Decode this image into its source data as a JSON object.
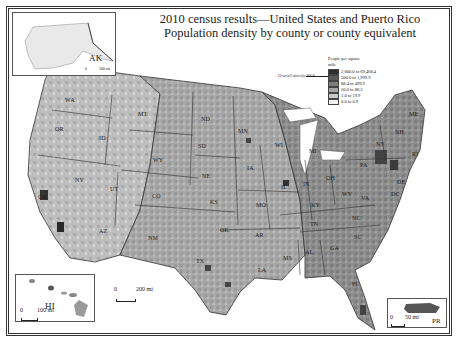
{
  "title": {
    "line1": "2010 census results—United States and Puerto Rico",
    "line2": "Population density by county or county equivalent"
  },
  "legend": {
    "header": "People per square mile",
    "items": [
      {
        "label": "2,000.0 to 69,468.4",
        "color": "#2e2e2e"
      },
      {
        "label": "500.0 to 1,999.9",
        "color": "#595959"
      },
      {
        "label": "88.4 to 499.9",
        "color": "#7e7e7e"
      },
      {
        "label": "20.0 to 88.3",
        "color": "#a4a4a4"
      },
      {
        "label": "1.0 to 19.9",
        "color": "#c8c8c8"
      },
      {
        "label": "0.0 to 0.9",
        "color": "#f2f2f2"
      }
    ],
    "overall_density": "Overall density 88.4"
  },
  "insets": {
    "alaska": {
      "label": "AK",
      "scale": "500 mi",
      "scale_zero": "0"
    },
    "hawaii": {
      "label": "HI",
      "scale": "100 mi",
      "scale_zero": "0"
    },
    "puerto_rico": {
      "label": "PR",
      "scale": "50 mi",
      "scale_zero": "0"
    }
  },
  "main_scale": {
    "zero": "0",
    "label": "200 mi"
  },
  "states": [
    {
      "abbr": "WA",
      "x": 70,
      "y": 101
    },
    {
      "abbr": "OR",
      "x": 60,
      "y": 130
    },
    {
      "abbr": "ID",
      "x": 104,
      "y": 139
    },
    {
      "abbr": "MT",
      "x": 143,
      "y": 115
    },
    {
      "abbr": "WY",
      "x": 158,
      "y": 161
    },
    {
      "abbr": "ND",
      "x": 206,
      "y": 120
    },
    {
      "abbr": "SD",
      "x": 203,
      "y": 147
    },
    {
      "abbr": "NE",
      "x": 207,
      "y": 177
    },
    {
      "abbr": "MN",
      "x": 243,
      "y": 132
    },
    {
      "abbr": "IA",
      "x": 252,
      "y": 169
    },
    {
      "abbr": "WI",
      "x": 280,
      "y": 146
    },
    {
      "abbr": "MI",
      "x": 314,
      "y": 152
    },
    {
      "abbr": "IL",
      "x": 286,
      "y": 188
    },
    {
      "abbr": "IN",
      "x": 308,
      "y": 185
    },
    {
      "abbr": "OH",
      "x": 331,
      "y": 179
    },
    {
      "abbr": "PA",
      "x": 365,
      "y": 166
    },
    {
      "abbr": "NY",
      "x": 381,
      "y": 145
    },
    {
      "abbr": "ME",
      "x": 414,
      "y": 115
    },
    {
      "abbr": "NH",
      "x": 400,
      "y": 133
    },
    {
      "abbr": "RI",
      "x": 417,
      "y": 155
    },
    {
      "abbr": "DE",
      "x": 402,
      "y": 183
    },
    {
      "abbr": "DC",
      "x": 396,
      "y": 195
    },
    {
      "abbr": "WV",
      "x": 347,
      "y": 195
    },
    {
      "abbr": "VA",
      "x": 366,
      "y": 199
    },
    {
      "abbr": "KY",
      "x": 316,
      "y": 206
    },
    {
      "abbr": "NV",
      "x": 80,
      "y": 181
    },
    {
      "abbr": "UT",
      "x": 115,
      "y": 190
    },
    {
      "abbr": "CO",
      "x": 157,
      "y": 197
    },
    {
      "abbr": "KS",
      "x": 215,
      "y": 203
    },
    {
      "abbr": "MO",
      "x": 261,
      "y": 206
    },
    {
      "abbr": "CA",
      "x": 43,
      "y": 198
    },
    {
      "abbr": "AZ",
      "x": 104,
      "y": 232
    },
    {
      "abbr": "NM",
      "x": 153,
      "y": 239
    },
    {
      "abbr": "OK",
      "x": 225,
      "y": 231
    },
    {
      "abbr": "AR",
      "x": 260,
      "y": 236
    },
    {
      "abbr": "TN",
      "x": 315,
      "y": 225
    },
    {
      "abbr": "NC",
      "x": 357,
      "y": 219
    },
    {
      "abbr": "SC",
      "x": 359,
      "y": 238
    },
    {
      "abbr": "GA",
      "x": 335,
      "y": 249
    },
    {
      "abbr": "AL",
      "x": 310,
      "y": 253
    },
    {
      "abbr": "MS",
      "x": 288,
      "y": 259
    },
    {
      "abbr": "LA",
      "x": 263,
      "y": 271
    },
    {
      "abbr": "TX",
      "x": 201,
      "y": 262
    },
    {
      "abbr": "FL",
      "x": 357,
      "y": 285
    }
  ]
}
